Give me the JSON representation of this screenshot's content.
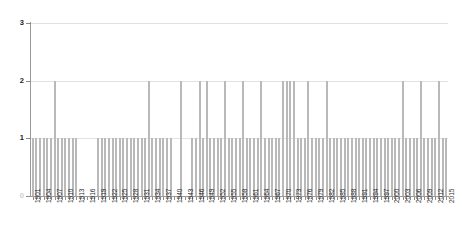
{
  "chart_data": {
    "type": "bar",
    "title": "",
    "subtitle": "",
    "xlabel": "",
    "ylabel": "",
    "ylim": [
      0,
      3
    ],
    "yticks": [
      "0",
      "1",
      "2",
      "3"
    ],
    "grid": true,
    "legend": "none",
    "bar_color": "#858585",
    "gridline_color": "#e2e2e2",
    "axis_color": "#9a9a9a",
    "label_tick_step": 3,
    "categories": [
      "1901",
      "1902",
      "1903",
      "1904",
      "1905",
      "1906",
      "1907",
      "1908",
      "1909",
      "1910",
      "1911",
      "1912",
      "1913",
      "1914",
      "1915",
      "1916",
      "1917",
      "1918",
      "1919",
      "1920",
      "1921",
      "1922",
      "1923",
      "1924",
      "1925",
      "1926",
      "1927",
      "1928",
      "1929",
      "1930",
      "1931",
      "1932",
      "1933",
      "1934",
      "1935",
      "1936",
      "1937",
      "1938",
      "1939",
      "1940",
      "1941",
      "1942",
      "1943",
      "1944",
      "1945",
      "1946",
      "1947",
      "1948",
      "1949",
      "1950",
      "1951",
      "1952",
      "1953",
      "1954",
      "1955",
      "1956",
      "1957",
      "1958",
      "1959",
      "1960",
      "1961",
      "1962",
      "1963",
      "1964",
      "1965",
      "1966",
      "1967",
      "1968",
      "1969",
      "1970",
      "1971",
      "1972",
      "1973",
      "1974",
      "1975",
      "1976",
      "1977",
      "1978",
      "1979",
      "1980",
      "1981",
      "1982",
      "1983",
      "1984",
      "1985",
      "1986",
      "1987",
      "1988",
      "1989",
      "1990",
      "1991",
      "1992",
      "1993",
      "1994",
      "1995",
      "1996",
      "1997",
      "1998",
      "1999",
      "2000",
      "2001",
      "2002",
      "2003",
      "2004",
      "2005",
      "2006",
      "2007",
      "2008",
      "2009",
      "2010",
      "2011",
      "2012",
      "2013",
      "2014",
      "2015"
    ],
    "values": [
      1,
      1,
      1,
      1,
      1,
      1,
      2,
      1,
      1,
      1,
      1,
      1,
      1,
      0,
      0,
      0,
      0,
      0,
      1,
      1,
      1,
      1,
      1,
      1,
      1,
      1,
      1,
      1,
      1,
      1,
      1,
      1,
      2,
      1,
      1,
      1,
      1,
      1,
      1,
      0,
      0,
      2,
      0,
      0,
      1,
      1,
      2,
      1,
      2,
      1,
      1,
      1,
      1,
      2,
      1,
      1,
      1,
      1,
      2,
      1,
      1,
      1,
      1,
      2,
      1,
      1,
      1,
      1,
      1,
      2,
      2,
      2,
      2,
      1,
      1,
      1,
      2,
      1,
      1,
      1,
      1,
      2,
      1,
      1,
      1,
      1,
      1,
      1,
      1,
      1,
      1,
      1,
      1,
      1,
      1,
      1,
      1,
      1,
      1,
      1,
      1,
      1,
      2,
      1,
      1,
      1,
      1,
      2,
      1,
      1,
      1,
      1,
      2,
      1,
      1
    ],
    "tick_labels": [
      "1901",
      "1904",
      "1907",
      "1910",
      "1913",
      "1916",
      "1919",
      "1922",
      "1925",
      "1928",
      "1931",
      "1934",
      "1937",
      "1940",
      "1943",
      "1946",
      "1949",
      "1952",
      "1955",
      "1958",
      "1961",
      "1964",
      "1967",
      "1970",
      "1973",
      "1976",
      "1979",
      "1982",
      "1985",
      "1988",
      "1991",
      "1994",
      "1997",
      "2000",
      "2003",
      "2006",
      "2009",
      "2012",
      "2015"
    ]
  }
}
